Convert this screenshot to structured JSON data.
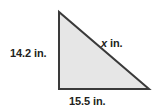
{
  "figure": {
    "type": "right-triangle-diagram",
    "background_color": "#ffffff",
    "shape": {
      "name": "right-triangle",
      "fill_color": "#e6e6e6",
      "stroke_color": "#3a3a3a",
      "stroke_width": 2,
      "vertices": {
        "apex": [
          59,
          12
        ],
        "right_angle": [
          59,
          89
        ],
        "bottom_right": [
          149,
          89
        ]
      }
    },
    "labels": {
      "vertical_leg": "14.2 in.",
      "horizontal_leg": "15.5 in.",
      "hypotenuse_variable": "x",
      "hypotenuse_unit": " in."
    },
    "measurements": {
      "vertical_leg_value": 14.2,
      "horizontal_leg_value": 15.5,
      "hypotenuse_value": "x",
      "units": "in."
    }
  }
}
